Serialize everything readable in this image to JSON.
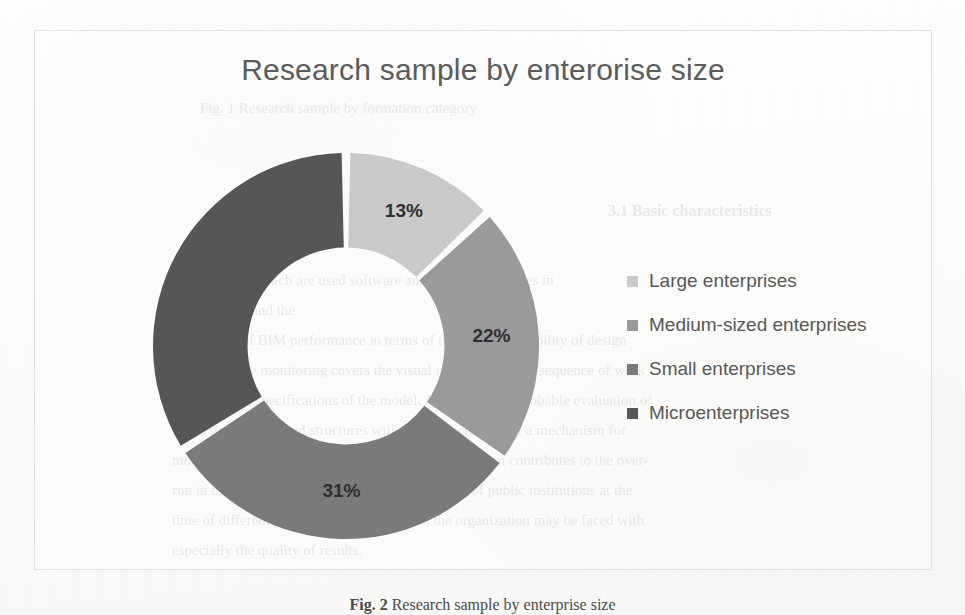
{
  "chart_data": {
    "type": "pie",
    "variant": "donut",
    "title": "Research sample by enterorise size",
    "categories": [
      "Large enterprises",
      "Medium-sized enterprises",
      "Small enterprises",
      "Microenterprises"
    ],
    "values": [
      13,
      22,
      31,
      34
    ],
    "value_labels": [
      "13%",
      "22%",
      "31%",
      ""
    ],
    "colors": [
      "#c9c9c9",
      "#9a9a9a",
      "#7a7a7a",
      "#565656"
    ],
    "unit": "%",
    "legend_position": "right",
    "grid": false,
    "start_angle_deg": 0,
    "direction": "clockwise",
    "inner_radius_ratio": 0.51,
    "xlabel": "",
    "ylabel": ""
  },
  "chart": {
    "title": "Research sample by enterorise size",
    "slices": [
      {
        "label": "Large enterprises",
        "value": 13,
        "display": "13%",
        "color": "#c9c9c9"
      },
      {
        "label": "Medium-sized enterprises",
        "value": 22,
        "display": "22%",
        "color": "#9a9a9a"
      },
      {
        "label": "Small enterprises",
        "value": 31,
        "display": "31%",
        "color": "#7a7a7a"
      },
      {
        "label": "Microenterprises",
        "value": 34,
        "display": "",
        "color": "#565656"
      }
    ]
  },
  "legend": {
    "items": [
      {
        "label": "Large enterprises",
        "color": "#c9c9c9"
      },
      {
        "label": "Medium-sized enterprises",
        "color": "#9a9a9a"
      },
      {
        "label": "Small enterprises",
        "color": "#7a7a7a"
      },
      {
        "label": "Microenterprises",
        "color": "#565656"
      }
    ]
  },
  "caption": {
    "prefix": "Fig. 2",
    "text": "Research sample by enterprise size"
  },
  "bleed_text": {
    "top_line": "Fig. 1 Research sample by formation category",
    "section_heading": "3.1  Basic characteristics",
    "lines": [
      "the extent to which are used software and BIM technologies in",
      "projects and the",
      "parameters of BIM performance in terms of the visual availability of design",
      "solutions. The monitoring covers the visual inspection of the sequence of work",
      "and technical specifications of the model. A model of the probable evaluation of",
      "the design aspects and structures will allow the creation of a mechanism for",
      "monitoring quality of operational control, which in turn contributes to the over-",
      "run in the time value of investment and financing of public institutions at the",
      "time of different project; in other accounts, the organization may be faced with",
      "especially the quality of results."
    ]
  }
}
